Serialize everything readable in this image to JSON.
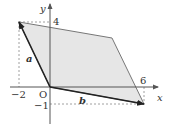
{
  "axes": {
    "x_label": "x",
    "y_label": "y",
    "origin_label": "O",
    "ticks": {
      "x_neg": "−2",
      "x_pos": "6",
      "y_pos": "4",
      "y_neg": "−1"
    }
  },
  "vectors": {
    "a": {
      "label": "a",
      "components": [
        -2,
        4
      ]
    },
    "b": {
      "label": "b",
      "components": [
        6,
        -1
      ]
    }
  },
  "parallelogram": {
    "vertices": [
      [
        0,
        0
      ],
      [
        -2,
        4
      ],
      [
        4,
        3
      ],
      [
        6,
        -1
      ]
    ],
    "fill": "#e6e6e6",
    "stroke": "#777777"
  }
}
